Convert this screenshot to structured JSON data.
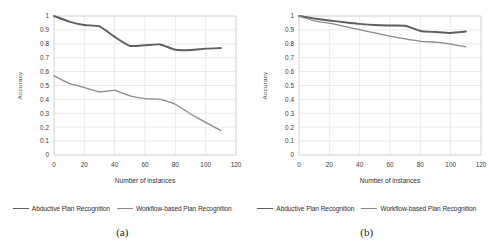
{
  "figure": {
    "panels": [
      {
        "caption": "(a)",
        "chart_data": {
          "type": "line",
          "title": "",
          "xlabel": "Number of instances",
          "ylabel": "Accuracy",
          "xlim": [
            0,
            120
          ],
          "ylim": [
            0,
            1
          ],
          "xticks": [
            0,
            20,
            40,
            60,
            80,
            100,
            120
          ],
          "xtick_labels": [
            "0",
            "20",
            "40",
            "60",
            "80",
            "100",
            "120"
          ],
          "yticks": [
            0,
            0.1,
            0.2,
            0.3,
            0.4,
            0.5,
            0.6,
            0.7,
            0.8,
            0.9,
            1
          ],
          "ytick_labels": [
            "0",
            "0.1",
            "0.2",
            "0.3",
            "0.4",
            "0.5",
            "0.6",
            "0.7",
            "0.8",
            "0.9",
            "1"
          ],
          "grid": true,
          "legend_position": "bottom",
          "x": [
            0,
            10,
            20,
            30,
            40,
            50,
            60,
            70,
            80,
            90,
            100,
            110
          ],
          "series": [
            {
              "name": "Abductive Plan Recognition",
              "color": "#5f5f5f",
              "values": [
                1.0,
                0.96,
                0.935,
                0.925,
                0.85,
                0.785,
                0.79,
                0.795,
                0.757,
                0.755,
                0.765,
                0.77
              ]
            },
            {
              "name": "Workflow-based Plan Recognition",
              "color": "#8a8a8a",
              "values": [
                0.57,
                0.515,
                0.485,
                0.455,
                0.465,
                0.425,
                0.405,
                0.4,
                0.365,
                0.295,
                0.235,
                0.175
              ]
            }
          ]
        }
      },
      {
        "caption": "(b)",
        "chart_data": {
          "type": "line",
          "title": "",
          "xlabel": "Number of instances",
          "ylabel": "Accuracy",
          "xlim": [
            0,
            120
          ],
          "ylim": [
            0,
            1
          ],
          "xticks": [
            0,
            20,
            40,
            60,
            80,
            100,
            120
          ],
          "xtick_labels": [
            "0",
            "20",
            "40",
            "60",
            "80",
            "100",
            "120"
          ],
          "yticks": [
            0,
            0.1,
            0.2,
            0.3,
            0.4,
            0.5,
            0.6,
            0.7,
            0.8,
            0.9,
            1
          ],
          "ytick_labels": [
            "0",
            "0.1",
            "0.2",
            "0.3",
            "0.4",
            "0.5",
            "0.6",
            "0.7",
            "0.8",
            "0.9",
            "1"
          ],
          "grid": true,
          "legend_position": "bottom",
          "x": [
            0,
            10,
            20,
            30,
            40,
            50,
            60,
            70,
            80,
            90,
            100,
            110
          ],
          "series": [
            {
              "name": "Abductive Plan Recognition",
              "color": "#5f5f5f",
              "values": [
                1.0,
                0.982,
                0.968,
                0.955,
                0.943,
                0.935,
                0.932,
                0.93,
                0.892,
                0.885,
                0.878,
                0.888
              ]
            },
            {
              "name": "Workflow-based Plan Recognition",
              "color": "#8a8a8a",
              "values": [
                1.0,
                0.965,
                0.948,
                0.925,
                0.902,
                0.878,
                0.855,
                0.835,
                0.818,
                0.812,
                0.798,
                0.778
              ]
            }
          ]
        }
      }
    ],
    "legend": {
      "items": [
        {
          "label": "Abductive Plan Recognition",
          "color": "#5f5f5f"
        },
        {
          "label": "Workflow-based Plan Recognition",
          "color": "#8a8a8a"
        }
      ]
    }
  }
}
